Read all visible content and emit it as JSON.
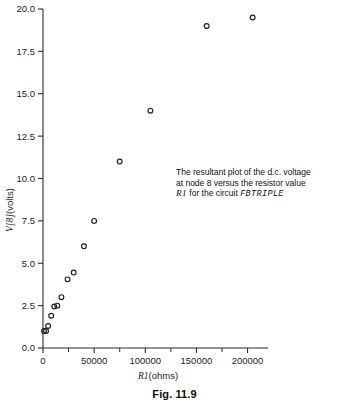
{
  "figure": {
    "caption": "Fig. 11.9",
    "annotation": {
      "line1": "The resultant plot of the d.c. voltage",
      "line2": "at node 8 versus the resistor value",
      "line3_var": "R1",
      "line3_mid": " for the circuit ",
      "line3_circuit": "FBTRIPLE"
    }
  },
  "chart_data": {
    "type": "scatter",
    "title": "",
    "xlabel_var": "R1",
    "xlabel_unit": "(ohms)",
    "ylabel_var": "V[8]",
    "ylabel_unit": "(volts)",
    "xlim": [
      0,
      220000
    ],
    "ylim": [
      0.0,
      20.0
    ],
    "grid": false,
    "legend": "none",
    "marker": "open-circle",
    "xticks": [
      0,
      50000,
      100000,
      150000,
      200000
    ],
    "xtick_labels": [
      "0",
      "50000",
      "100000",
      "150000",
      "200000"
    ],
    "xminor_ticks": [
      25000,
      75000,
      125000,
      175000
    ],
    "yticks": [
      0.0,
      2.5,
      5.0,
      7.5,
      10.0,
      12.5,
      15.0,
      17.5,
      20.0
    ],
    "ytick_labels": [
      "0.0",
      "2.5",
      "5.0",
      "7.5",
      "10.0",
      "12.5",
      "15.0",
      "17.5",
      "20.0"
    ],
    "x": [
      1000,
      3000,
      5000,
      8000,
      11000,
      14000,
      18000,
      24000,
      30000,
      40000,
      50000,
      75000,
      105000,
      160000,
      205000
    ],
    "y": [
      1.0,
      1.0,
      1.3,
      1.9,
      2.45,
      2.5,
      3.0,
      4.05,
      4.45,
      6.0,
      7.5,
      11.0,
      14.0,
      19.0,
      19.5
    ],
    "points": [
      {
        "x": 1000,
        "y": 1.0
      },
      {
        "x": 3000,
        "y": 1.0
      },
      {
        "x": 5000,
        "y": 1.3
      },
      {
        "x": 8000,
        "y": 1.9
      },
      {
        "x": 11000,
        "y": 2.45
      },
      {
        "x": 14000,
        "y": 2.5
      },
      {
        "x": 18000,
        "y": 3.0
      },
      {
        "x": 24000,
        "y": 4.05
      },
      {
        "x": 30000,
        "y": 4.45
      },
      {
        "x": 40000,
        "y": 6.0
      },
      {
        "x": 50000,
        "y": 7.5
      },
      {
        "x": 75000,
        "y": 11.0
      },
      {
        "x": 105000,
        "y": 14.0
      },
      {
        "x": 160000,
        "y": 19.0
      },
      {
        "x": 205000,
        "y": 19.5
      }
    ]
  }
}
